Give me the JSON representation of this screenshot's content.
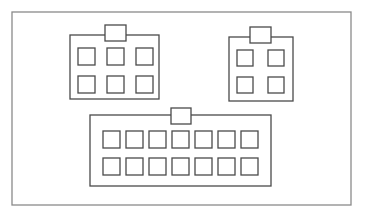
{
  "diagram": {
    "title": "",
    "stroke_color": "#4a4a4a",
    "frame_color": "#8a8a8a",
    "background": "#ffffff",
    "frame": {
      "x": 12,
      "y": 12,
      "w": 339,
      "h": 193
    },
    "connectors": [
      {
        "id": "connector-6-pin",
        "pins": 6,
        "rows": 2,
        "cols": 3,
        "body": {
          "x": 70,
          "y": 35,
          "w": 89,
          "h": 64
        },
        "tab": {
          "x": 105,
          "y": 25,
          "w": 21,
          "h": 16
        },
        "pin_size": 17,
        "pin_origin": {
          "x": 78,
          "y": 48
        },
        "pin_step": {
          "x": 29,
          "y": 28
        }
      },
      {
        "id": "connector-4-pin",
        "pins": 4,
        "rows": 2,
        "cols": 2,
        "body": {
          "x": 229,
          "y": 37,
          "w": 64,
          "h": 64
        },
        "tab": {
          "x": 250,
          "y": 27,
          "w": 21,
          "h": 16
        },
        "pin_size": 16,
        "pin_origin": {
          "x": 237,
          "y": 50
        },
        "pin_step": {
          "x": 31,
          "y": 27
        }
      },
      {
        "id": "connector-14-pin",
        "pins": 14,
        "rows": 2,
        "cols": 7,
        "body": {
          "x": 90,
          "y": 115,
          "w": 181,
          "h": 71
        },
        "tab": {
          "x": 171,
          "y": 108,
          "w": 20,
          "h": 16
        },
        "pin_size": 17,
        "pin_origin": {
          "x": 103,
          "y": 131
        },
        "pin_step": {
          "x": 23,
          "y": 27
        }
      }
    ]
  }
}
